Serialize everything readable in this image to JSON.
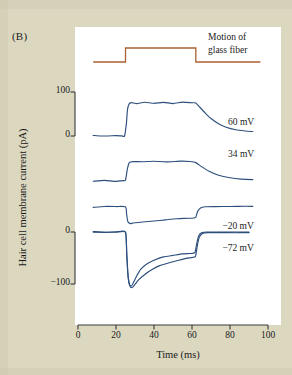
{
  "panel": {
    "label": "(B)"
  },
  "colors": {
    "background": "#dcd8c0",
    "plot_background": "#ffffff",
    "trace": "#2d4f7c",
    "stimulus": "#a9622f",
    "axis": "#3a3a3a",
    "text": "#1a1a1a"
  },
  "stimulus": {
    "caption_line1": "Motion of",
    "caption_line2": "glass fiber"
  },
  "chart_data": {
    "type": "line",
    "title": "",
    "xlabel": "Time (ms)",
    "ylabel": "Hair cell membrane current (pA)",
    "xlim": [
      0,
      100
    ],
    "xticks": [
      0,
      20,
      40,
      60,
      80,
      100
    ],
    "xtick_labels": [
      "0",
      "20",
      "40",
      "60",
      "80",
      "100"
    ],
    "grid": false,
    "legend_position": "inline-right",
    "y_scalebars": [
      {
        "name": "upper-scalebar",
        "ticks": [
          100,
          0
        ],
        "tick_labels": [
          "100",
          "0"
        ],
        "units": "pA"
      },
      {
        "name": "lower-scalebar",
        "ticks": [
          0,
          -100
        ],
        "tick_labels": [
          "0",
          "-100"
        ],
        "units": "pA"
      }
    ],
    "stimulus_trace": {
      "name": "Motion of glass fiber",
      "color": "#a9622f",
      "onset_ms": 25,
      "offset_ms": 62,
      "baseline_level": 0,
      "step_level": 1
    },
    "series": [
      {
        "name": "60 mV",
        "label": "60 mV",
        "holding_potential_mV": 60,
        "baseline_pA": 0,
        "peak_pA": 78,
        "plateau_pA": 75,
        "after_offset_pA": 8,
        "color": "#2d4f7c",
        "points": [
          [
            8,
            0
          ],
          [
            12,
            1
          ],
          [
            16,
            -1
          ],
          [
            20,
            1
          ],
          [
            23,
            0
          ],
          [
            24.5,
            0
          ],
          [
            25.5,
            30
          ],
          [
            26,
            58
          ],
          [
            26.8,
            72
          ],
          [
            28,
            76
          ],
          [
            31,
            74
          ],
          [
            35,
            77
          ],
          [
            40,
            74
          ],
          [
            45,
            77
          ],
          [
            50,
            74
          ],
          [
            55,
            77
          ],
          [
            60,
            76
          ],
          [
            62,
            75
          ],
          [
            64,
            66
          ],
          [
            67,
            52
          ],
          [
            70,
            40
          ],
          [
            74,
            28
          ],
          [
            78,
            20
          ],
          [
            83,
            14
          ],
          [
            88,
            11
          ],
          [
            92,
            10
          ]
        ]
      },
      {
        "name": "34 mV",
        "label": "34 mV",
        "holding_potential_mV": 34,
        "baseline_pA": 0,
        "plateau_pA": 44,
        "after_offset_pA": 2,
        "color": "#2d4f7c",
        "points": [
          [
            8,
            0
          ],
          [
            14,
            1
          ],
          [
            19,
            -1
          ],
          [
            24,
            0
          ],
          [
            25,
            2
          ],
          [
            26,
            28
          ],
          [
            27,
            42
          ],
          [
            29,
            44
          ],
          [
            34,
            44
          ],
          [
            40,
            45
          ],
          [
            47,
            44
          ],
          [
            54,
            45
          ],
          [
            59,
            44
          ],
          [
            62,
            42
          ],
          [
            65,
            33
          ],
          [
            69,
            22
          ],
          [
            74,
            13
          ],
          [
            80,
            7
          ],
          [
            86,
            4
          ],
          [
            92,
            3
          ]
        ]
      },
      {
        "name": "-20 mV",
        "label": "−20 mV",
        "holding_potential_mV": -20,
        "baseline_pA": 0,
        "peak_pA": -32,
        "plateau_pA": -22,
        "color": "#2d4f7c",
        "points": [
          [
            8,
            0
          ],
          [
            14,
            0
          ],
          [
            20,
            0
          ],
          [
            25,
            0
          ],
          [
            25.6,
            -14
          ],
          [
            26.2,
            -28
          ],
          [
            27.5,
            -32
          ],
          [
            29,
            -31
          ],
          [
            34,
            -29
          ],
          [
            40,
            -27
          ],
          [
            46,
            -25
          ],
          [
            52,
            -23
          ],
          [
            58,
            -22
          ],
          [
            61,
            -21
          ],
          [
            62,
            -20
          ],
          [
            63,
            -8
          ],
          [
            64.5,
            -2
          ],
          [
            67,
            0
          ],
          [
            72,
            1
          ],
          [
            80,
            1
          ],
          [
            88,
            1
          ],
          [
            92,
            1
          ]
        ]
      },
      {
        "name": "-72 mV (trace a)",
        "label": "−72 mV",
        "holding_potential_mV": -72,
        "baseline_pA": 0,
        "peak_pA": -104,
        "plateau_pA": -40,
        "color": "#2d4f7c",
        "points": [
          [
            8,
            0
          ],
          [
            14,
            0
          ],
          [
            20,
            0
          ],
          [
            25,
            0
          ],
          [
            25.6,
            -40
          ],
          [
            26.2,
            -80
          ],
          [
            27,
            -100
          ],
          [
            28,
            -104
          ],
          [
            29,
            -98
          ],
          [
            31,
            -84
          ],
          [
            33,
            -72
          ],
          [
            36,
            -62
          ],
          [
            40,
            -54
          ],
          [
            45,
            -48
          ],
          [
            50,
            -45
          ],
          [
            55,
            -42
          ],
          [
            59,
            -41
          ],
          [
            61.5,
            -40
          ],
          [
            62.5,
            -22
          ],
          [
            63.5,
            -8
          ],
          [
            65,
            -2
          ],
          [
            68,
            0
          ],
          [
            74,
            0
          ],
          [
            82,
            0
          ],
          [
            90,
            0
          ]
        ]
      },
      {
        "name": "-72 mV (trace b)",
        "label": "",
        "holding_potential_mV": -72,
        "baseline_pA": 0,
        "peak_pA": -107,
        "plateau_pA": -47,
        "color": "#2d4f7c",
        "points": [
          [
            8,
            0
          ],
          [
            14,
            0
          ],
          [
            20,
            0
          ],
          [
            25,
            0
          ],
          [
            25.7,
            -44
          ],
          [
            26.4,
            -86
          ],
          [
            27.2,
            -103
          ],
          [
            28.3,
            -107
          ],
          [
            29.5,
            -103
          ],
          [
            32,
            -92
          ],
          [
            35,
            -82
          ],
          [
            39,
            -72
          ],
          [
            43,
            -65
          ],
          [
            48,
            -59
          ],
          [
            53,
            -54
          ],
          [
            57,
            -51
          ],
          [
            60,
            -49
          ],
          [
            61.8,
            -47
          ],
          [
            62.8,
            -26
          ],
          [
            63.8,
            -10
          ],
          [
            65.5,
            -3
          ],
          [
            68.5,
            -1
          ],
          [
            75,
            -1
          ],
          [
            83,
            -1
          ],
          [
            90,
            -1
          ]
        ]
      }
    ],
    "trace_labels": [
      {
        "text": "60 mV",
        "x_ms": 79,
        "y_pA": 30
      },
      {
        "text": "34 mV",
        "x_ms": 79,
        "y_pA": 58
      },
      {
        "text": "−20 mV",
        "x_ms": 76,
        "y_pA": 10
      },
      {
        "text": "−72 mV",
        "x_ms": 76,
        "y_pA": -32
      }
    ]
  }
}
